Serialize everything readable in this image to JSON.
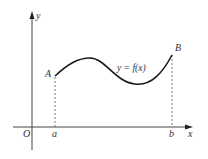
{
  "diagram": {
    "type": "function-graph",
    "axes": {
      "y_label": "y",
      "x_label": "x",
      "origin_label": "O"
    },
    "curve": {
      "label": "y = f(x)",
      "color": "#1a1a1a"
    },
    "points": {
      "start": "A",
      "end": "B"
    },
    "x_ticks": {
      "left": "a",
      "right": "b"
    },
    "colors": {
      "axis": "#444444",
      "dashed": "#777777",
      "text": "#333333"
    }
  }
}
